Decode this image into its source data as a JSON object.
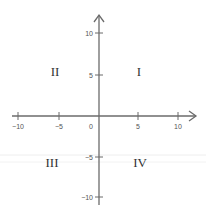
{
  "diagram": {
    "axis_color": "#6b6b6b",
    "x_ticks": [
      {
        "value": -10,
        "label": "−10"
      },
      {
        "value": -5,
        "label": "−5"
      },
      {
        "value": 5,
        "label": "5"
      },
      {
        "value": 10,
        "label": "10"
      }
    ],
    "y_ticks": [
      {
        "value": 10,
        "label": "10"
      },
      {
        "value": 5,
        "label": "5"
      },
      {
        "value": -5,
        "label": "−5"
      },
      {
        "value": -10,
        "label": "−10"
      }
    ],
    "origin_label": "0",
    "quadrants": {
      "I": "I",
      "II": "II",
      "III": "III",
      "IV": "IV"
    }
  }
}
